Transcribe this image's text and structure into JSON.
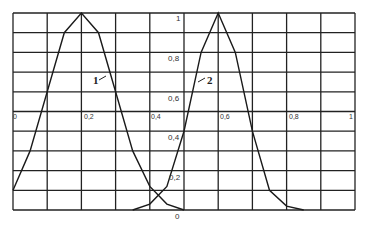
{
  "chart_data": {
    "type": "line",
    "title": "",
    "xlabel": "",
    "ylabel": "",
    "xlim": [
      0,
      1
    ],
    "ylim": [
      0,
      1
    ],
    "grid": true,
    "x_tick_labels": [
      "0",
      "0,2",
      "0,4",
      "0,6",
      "0,8",
      "1"
    ],
    "y_tick_labels": [
      "0",
      "0,2",
      "0,4",
      "0,6",
      "0,8",
      "1"
    ],
    "series": [
      {
        "name": "1",
        "x": [
          0.0,
          0.05,
          0.1,
          0.15,
          0.2,
          0.25,
          0.3,
          0.35,
          0.4,
          0.45,
          0.5
        ],
        "values": [
          0.1,
          0.3,
          0.6,
          0.9,
          1.0,
          0.9,
          0.6,
          0.3,
          0.12,
          0.03,
          0.0
        ]
      },
      {
        "name": "2",
        "x": [
          0.35,
          0.4,
          0.45,
          0.5,
          0.55,
          0.6,
          0.65,
          0.7,
          0.75,
          0.8,
          0.85
        ],
        "values": [
          0.0,
          0.03,
          0.12,
          0.4,
          0.8,
          1.0,
          0.8,
          0.4,
          0.1,
          0.02,
          0.0
        ]
      }
    ],
    "annotations": [
      {
        "text": "1",
        "series": "1"
      },
      {
        "text": "2",
        "series": "2"
      }
    ]
  },
  "labels": {
    "curve1": "1",
    "curve2": "2",
    "x": [
      "0",
      "0,2",
      "0,4",
      "0,6",
      "0,8",
      "1"
    ],
    "y": [
      "1",
      "0,8",
      "0,6",
      "0,4",
      "0,2",
      "0"
    ]
  }
}
